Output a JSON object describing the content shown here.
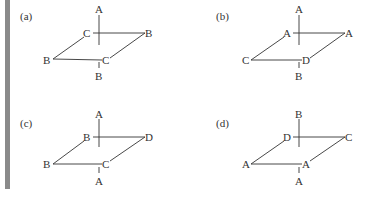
{
  "figure": {
    "panels": [
      {
        "tag": "(a)",
        "top": "A",
        "back_left": "C",
        "back_right": "B",
        "front_left": "B",
        "front_right": "C",
        "bottom": "B"
      },
      {
        "tag": "(b)",
        "top": "A",
        "back_left": "A",
        "back_right": "A",
        "front_left": "C",
        "front_right": "D",
        "bottom": "B"
      },
      {
        "tag": "(c)",
        "top": "A",
        "back_left": "B",
        "back_right": "D",
        "front_left": "B",
        "front_right": "C",
        "bottom": "A"
      },
      {
        "tag": "(d)",
        "top": "B",
        "back_left": "D",
        "back_right": "C",
        "front_left": "A",
        "front_right": "A",
        "bottom": "A"
      }
    ]
  },
  "colors": {
    "bar": "#8a8a8a",
    "ink": "#333333"
  }
}
